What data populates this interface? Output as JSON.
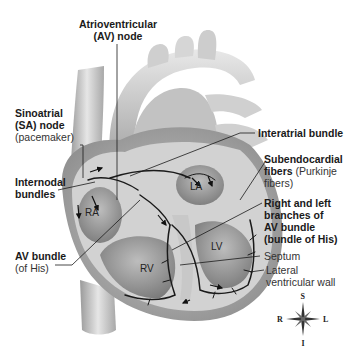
{
  "labels": {
    "av_node": {
      "line1": "Atrioventricular",
      "line2": "(AV) node"
    },
    "sa_node": {
      "line1": "Sinoatrial",
      "line2": "(SA) node",
      "line3": "(pacemaker)"
    },
    "internodal": {
      "line1": "Internodal",
      "line2": "bundles"
    },
    "av_bundle": {
      "line1": "AV bundle",
      "line2": "(of His)"
    },
    "interatrial": {
      "text": "Interatrial bundle"
    },
    "subendocardial": {
      "line1_bold": "Subendocardial",
      "line2_bold": "fibers",
      "line2_normal": " (Purkinje",
      "line3": "fibers)"
    },
    "branches": {
      "line1": "Right and left",
      "line2": "branches of",
      "line3": "AV bundle",
      "line4": "(bundle of His)"
    },
    "septum": {
      "text": "Septum"
    },
    "lateral_wall": {
      "line1": "Lateral",
      "line2": "ventricular wall"
    }
  },
  "chambers": {
    "ra": "RA",
    "la": "LA",
    "rv": "RV",
    "lv": "LV"
  },
  "compass": {
    "superior": "S",
    "inferior": "I",
    "right": "R",
    "left": "L"
  },
  "colors": {
    "tissue_light": "#d9d9d9",
    "tissue_mid": "#b5b5b5",
    "tissue_dark": "#7a7a7a",
    "pathway": "#1a1a1a"
  }
}
